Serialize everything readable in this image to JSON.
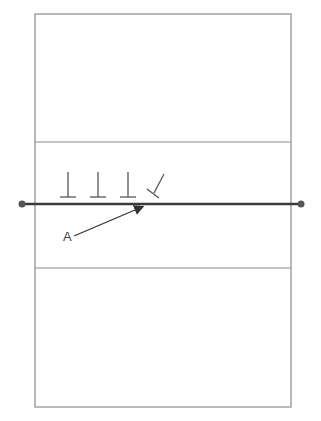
{
  "diagram": {
    "type": "volleyball-court",
    "colors": {
      "court_line": "#8a8a8a",
      "net": "#3a3a3a",
      "post": "#555555",
      "player": "#555555",
      "arrow": "#333333"
    },
    "court": {
      "x": 35,
      "y": 14,
      "width": 256,
      "height": 393
    },
    "attack_lines_y": [
      142,
      268
    ],
    "net": {
      "y": 204,
      "x1": 22,
      "x2": 301
    },
    "blockers": [
      {
        "x": 68,
        "orientation": "upright"
      },
      {
        "x": 98,
        "orientation": "upright"
      },
      {
        "x": 128,
        "orientation": "upright"
      },
      {
        "x": 155,
        "orientation": "tilted"
      }
    ],
    "attacker": {
      "label": "A",
      "x": 67,
      "y": 240
    },
    "arrow": {
      "from": [
        74,
        236
      ],
      "to": [
        144,
        206
      ]
    }
  }
}
